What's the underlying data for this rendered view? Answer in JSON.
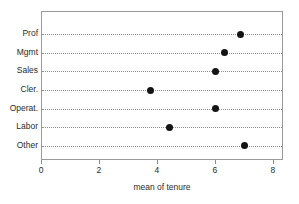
{
  "chart_data": {
    "type": "scatter",
    "title": "",
    "subtitle": "",
    "xlabel": "mean of tenure",
    "ylabel": "",
    "categories": [
      "Prof",
      "Mgmt",
      "Sales",
      "Cler.",
      "Operat.",
      "Labor",
      "Other"
    ],
    "values": [
      6.85,
      6.3,
      6.0,
      3.75,
      6.0,
      4.4,
      7.0
    ],
    "xlim": [
      0,
      8.35
    ],
    "xticks": [
      0,
      2,
      4,
      6,
      8
    ],
    "xtick_labels": [
      "0",
      "2",
      "4",
      "6",
      "8"
    ],
    "grid": true,
    "grid_orientation": "horizontal",
    "legend": false,
    "legend_position": "none",
    "marker": "filled-circle",
    "marker_color": "#141414",
    "frame_color": "#9a9a9a",
    "grid_color": "#8e8e8e",
    "background": "#ffffff"
  }
}
